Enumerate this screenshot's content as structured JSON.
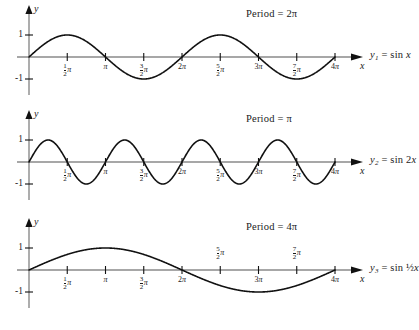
{
  "figure": {
    "background": "#ffffff",
    "curve_color": "#111111",
    "axis_color": "#8a8a8a",
    "caption": ""
  },
  "axis_letters": {
    "x": "x",
    "y": "y"
  },
  "y_ticks": [
    {
      "value": 1,
      "label": "1"
    },
    {
      "value": -1,
      "label": "-1"
    }
  ],
  "x_ticks": [
    {
      "value": 0.5,
      "num": "1",
      "den": "2",
      "whole": "",
      "pi": "π"
    },
    {
      "value": 1.0,
      "num": "",
      "den": "",
      "whole": "",
      "pi": "π"
    },
    {
      "value": 1.5,
      "num": "3",
      "den": "2",
      "whole": "",
      "pi": "π"
    },
    {
      "value": 2.0,
      "num": "",
      "den": "",
      "whole": "2",
      "pi": "π"
    },
    {
      "value": 2.5,
      "num": "5",
      "den": "2",
      "whole": "",
      "pi": "π"
    },
    {
      "value": 3.0,
      "num": "",
      "den": "",
      "whole": "3",
      "pi": "π"
    },
    {
      "value": 3.5,
      "num": "7",
      "den": "2",
      "whole": "",
      "pi": "π"
    },
    {
      "value": 4.0,
      "num": "",
      "den": "",
      "whole": "4",
      "pi": "π"
    }
  ],
  "panels": [
    {
      "id": "graph-sin-x",
      "period_label": "Period = 2π",
      "function_label_html": "y<sub>1</sub> = sin x",
      "function_plain": "y1 = sin x",
      "labels_above_axis": []
    },
    {
      "id": "graph-sin-2x",
      "period_label": "Period = π",
      "function_label_html": "y<sub>2</sub> = sin 2x",
      "function_plain": "y2 = sin 2x",
      "labels_above_axis": []
    },
    {
      "id": "graph-sin-half-x",
      "period_label": "Period = 4π",
      "function_label_html": "y<sub>3</sub> = sin ½x",
      "function_plain": "y3 = sin (1/2)x",
      "labels_above_axis": [
        2.5,
        3.5
      ]
    }
  ],
  "chart_data": [
    {
      "type": "line",
      "title": "Period = 2π",
      "series": [
        {
          "name": "y1 = sin x",
          "frequency": 1,
          "amplitude": 1,
          "expression": "sin(x)"
        }
      ],
      "xlabel": "x",
      "ylabel": "y",
      "xlim": [
        0,
        12.566370614
      ],
      "ylim": [
        -1.35,
        1.35
      ],
      "x_unit": "pi",
      "xticks": [
        0.5,
        1,
        1.5,
        2,
        2.5,
        3,
        3.5,
        4
      ],
      "xticklabels": [
        "1/2 π",
        "π",
        "3/2 π",
        "2π",
        "5/2 π",
        "3π",
        "7/2 π",
        "4π"
      ],
      "yticks": [
        -1,
        1
      ],
      "yticklabels": [
        "-1",
        "1"
      ],
      "grid": false,
      "legend": "right-outside",
      "period": "2π",
      "cycles_shown": 2
    },
    {
      "type": "line",
      "title": "Period = π",
      "series": [
        {
          "name": "y2 = sin 2x",
          "frequency": 2,
          "amplitude": 1,
          "expression": "sin(2x)"
        }
      ],
      "xlabel": "x",
      "ylabel": "y",
      "xlim": [
        0,
        12.566370614
      ],
      "ylim": [
        -1.35,
        1.35
      ],
      "x_unit": "pi",
      "xticks": [
        0.5,
        1,
        1.5,
        2,
        2.5,
        3,
        3.5,
        4
      ],
      "xticklabels": [
        "1/2 π",
        "π",
        "3/2 π",
        "2π",
        "5/2 π",
        "3π",
        "7/2 π",
        "4π"
      ],
      "yticks": [
        -1,
        1
      ],
      "yticklabels": [
        "-1",
        "1"
      ],
      "grid": false,
      "legend": "right-outside",
      "period": "π",
      "cycles_shown": 4
    },
    {
      "type": "line",
      "title": "Period = 4π",
      "series": [
        {
          "name": "y3 = sin (1/2)x",
          "frequency": 0.5,
          "amplitude": 1,
          "expression": "sin(x/2)"
        }
      ],
      "xlabel": "x",
      "ylabel": "y",
      "xlim": [
        0,
        12.566370614
      ],
      "ylim": [
        -1.35,
        1.35
      ],
      "x_unit": "pi",
      "xticks": [
        0.5,
        1,
        1.5,
        2,
        2.5,
        3,
        3.5,
        4
      ],
      "xticklabels": [
        "1/2 π",
        "π",
        "3/2 π",
        "2π",
        "5/2 π",
        "3π",
        "7/2 π",
        "4π"
      ],
      "yticks": [
        -1,
        1
      ],
      "yticklabels": [
        "-1",
        "1"
      ],
      "grid": false,
      "legend": "right-outside",
      "period": "4π",
      "cycles_shown": 1
    }
  ]
}
